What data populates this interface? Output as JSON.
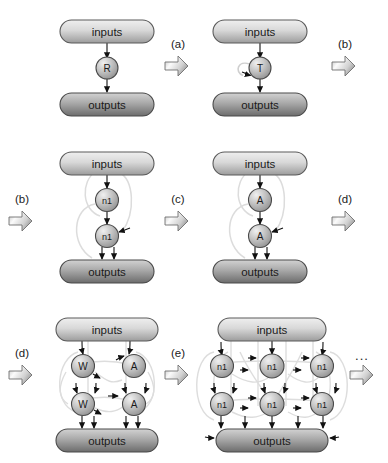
{
  "diagram": {
    "colors": {
      "inputs_light": "#e6e6e6",
      "inputs_dark": "#9a9a9a",
      "outputs_light": "#cfcfcf",
      "outputs_dark": "#6e6e6e",
      "node_light": "#e8e8e8",
      "node_dark": "#8e8e8e",
      "stroke": "#4a4a4a",
      "edge": "#d8d8d8",
      "arrow_glyph_light": "#f2f2f2",
      "arrow_glyph_dark": "#9c9c9c",
      "text": "#1a1a1a",
      "background": "#ffffff"
    },
    "labels": {
      "inputs": "inputs",
      "outputs": "outputs",
      "ellipsis": "..."
    },
    "steps": [
      {
        "id": "a",
        "label": "(a)"
      },
      {
        "id": "b",
        "label": "(b)"
      },
      {
        "id": "b2",
        "label": "(b)"
      },
      {
        "id": "c",
        "label": "(c)"
      },
      {
        "id": "d",
        "label": "(d)"
      },
      {
        "id": "d2",
        "label": "(d)"
      },
      {
        "id": "e",
        "label": "(e)"
      },
      {
        "id": "more",
        "label": "..."
      }
    ],
    "panels": [
      {
        "id": "panel-1",
        "row": 1,
        "position": "left",
        "input_label": "inputs",
        "output_label": "outputs",
        "grid": {
          "rows": 1,
          "cols": 1
        },
        "nodes": [
          {
            "label": "R"
          }
        ],
        "self_loop": false
      },
      {
        "id": "panel-2",
        "row": 1,
        "position": "right",
        "input_label": "inputs",
        "output_label": "outputs",
        "grid": {
          "rows": 1,
          "cols": 1
        },
        "nodes": [
          {
            "label": "T"
          }
        ],
        "self_loop": true
      },
      {
        "id": "panel-3",
        "row": 2,
        "position": "left",
        "input_label": "inputs",
        "output_label": "outputs",
        "grid": {
          "rows": 2,
          "cols": 1
        },
        "nodes": [
          {
            "label": "n1"
          },
          {
            "label": "n1"
          }
        ],
        "self_loop": false
      },
      {
        "id": "panel-4",
        "row": 2,
        "position": "right",
        "input_label": "inputs",
        "output_label": "outputs",
        "grid": {
          "rows": 2,
          "cols": 1
        },
        "nodes": [
          {
            "label": "A"
          },
          {
            "label": "A"
          }
        ],
        "self_loop": false
      },
      {
        "id": "panel-5",
        "row": 3,
        "position": "left",
        "input_label": "inputs",
        "output_label": "outputs",
        "grid": {
          "rows": 2,
          "cols": 2
        },
        "nodes": [
          {
            "label": "W"
          },
          {
            "label": "A"
          },
          {
            "label": "W"
          },
          {
            "label": "A"
          }
        ],
        "self_loop": false
      },
      {
        "id": "panel-6",
        "row": 3,
        "position": "right",
        "input_label": "inputs",
        "output_label": "outputs",
        "grid": {
          "rows": 2,
          "cols": 3
        },
        "nodes": [
          {
            "label": "n1"
          },
          {
            "label": "n1"
          },
          {
            "label": "n1"
          },
          {
            "label": "n1"
          },
          {
            "label": "n1"
          },
          {
            "label": "n1"
          }
        ],
        "self_loop": false
      }
    ]
  }
}
